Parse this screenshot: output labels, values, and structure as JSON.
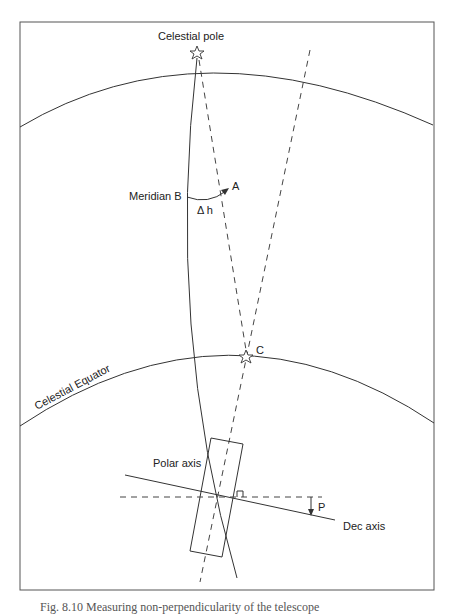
{
  "figure": {
    "labels": {
      "celestial_pole": "Celestial pole",
      "meridian_b": "Meridian B",
      "point_a": "A",
      "delta_h": "Δ h",
      "point_c": "C",
      "celestial_equator": "Celestial Equator",
      "polar_axis": "Polar axis",
      "dec_axis": "Dec axis",
      "p": "P"
    },
    "icons": {
      "pole_star": "star-outline-icon",
      "c_star": "star-outline-icon"
    },
    "colors": {
      "line": "#333333",
      "frame": "#555555",
      "background": "#ffffff"
    }
  },
  "caption": "Fig. 8.10  Measuring non-perpendicularity of the telescope"
}
